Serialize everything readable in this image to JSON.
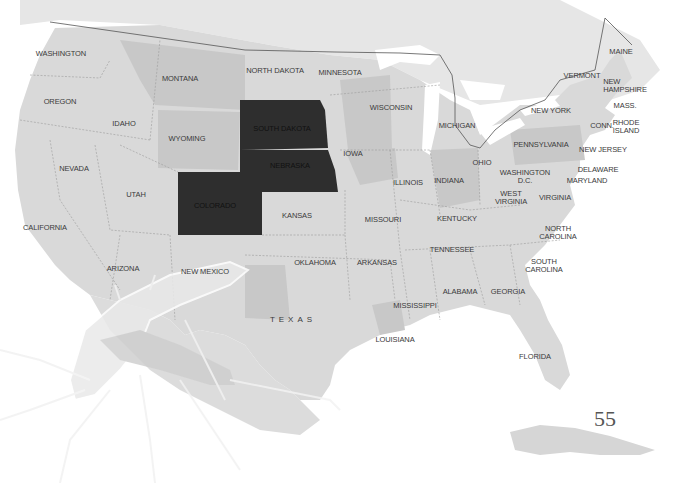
{
  "map": {
    "title": "United States",
    "highlight_color": "#2e2e2e",
    "land_color": "#d9d9d9",
    "shaded_color": "#c4c4c4",
    "canada_color": "#e4e4e4",
    "water_color": "#ffffff",
    "highlighted_states": [
      "South Dakota",
      "Nebraska",
      "Colorado"
    ],
    "labels": {
      "washington": "WASHINGTON",
      "oregon": "OREGON",
      "idaho": "IDAHO",
      "montana": "MONTANA",
      "wyoming": "WYOMING",
      "north_dakota": "NORTH DAKOTA",
      "south_dakota": "SOUTH DAKOTA",
      "minnesota": "MINNESOTA",
      "nebraska": "NEBRASKA",
      "nevada": "NEVADA",
      "utah": "UTAH",
      "colorado": "COLORADO",
      "california": "CALIFORNIA",
      "arizona": "ARIZONA",
      "new_mexico": "NEW MEXICO",
      "kansas": "KANSAS",
      "oklahoma": "OKLAHOMA",
      "texas": "TEXAS",
      "iowa": "IOWA",
      "wisconsin": "WISCONSIN",
      "michigan": "MICHIGAN",
      "illinois": "ILLINOIS",
      "indiana": "INDIANA",
      "ohio": "OHIO",
      "missouri": "MISSOURI",
      "arkansas": "ARKANSAS",
      "louisiana": "LOUISIANA",
      "mississippi": "MISSISSIPPI",
      "alabama": "ALABAMA",
      "georgia": "GEORGIA",
      "florida": "FLORIDA",
      "tennessee": "TENNESSEE",
      "kentucky": "KENTUCKY",
      "west_virginia": "WEST\nVIRGINIA",
      "virginia": "VIRGINIA",
      "washington_dc": "WASHINGTON\nD.C.",
      "maryland": "MARYLAND",
      "delaware": "DELAWARE",
      "new_jersey": "NEW JERSEY",
      "pennsylvania": "PENNSYLVANIA",
      "new_york": "NEW YORK",
      "vermont": "VERMONT",
      "new_hampshire": "NEW\nHAMPSHIRE",
      "maine": "MAINE",
      "mass": "MASS.",
      "conn": "CONN.",
      "rhode_island": "RHODE\nISLAND",
      "north_carolina": "NORTH\nCAROLINA",
      "south_carolina": "SOUTH\nCAROLINA"
    }
  },
  "page": {
    "number": "55"
  }
}
